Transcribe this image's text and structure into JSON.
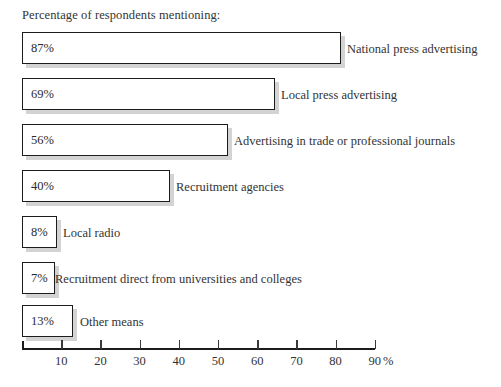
{
  "caption": "Percentage of respondents mentioning:",
  "axis": {
    "unit_label": "%",
    "tick_labels": [
      "10",
      "20",
      "30",
      "40",
      "50",
      "60",
      "70",
      "80",
      "90"
    ]
  },
  "chart_data": {
    "type": "bar",
    "orientation": "horizontal",
    "title": "Percentage of respondents mentioning:",
    "xlabel": "%",
    "ylabel": "",
    "xlim": [
      0,
      90
    ],
    "grid": false,
    "legend": "none",
    "categories": [
      "National press advertising",
      "Local press advertising",
      "Advertising in trade or professional journals",
      "Recruitment agencies",
      "Local radio",
      "Recruitment direct from universities and colleges",
      "Other means"
    ],
    "values": [
      87,
      69,
      56,
      40,
      8,
      7,
      13
    ],
    "value_labels": [
      "87%",
      "69%",
      "56%",
      "40%",
      "8%",
      "7%",
      "13%"
    ],
    "tick_values": [
      10,
      20,
      30,
      40,
      50,
      60,
      70,
      80,
      90
    ]
  },
  "render": {
    "bars": [
      {
        "label": "National press advertising",
        "value_label": "87%",
        "top": 32,
        "width": 319,
        "label_x": 347
      },
      {
        "label": "Local press advertising",
        "value_label": "69%",
        "top": 78,
        "width": 253,
        "label_x": 281
      },
      {
        "label": "Advertising in trade or professional journals",
        "value_label": "56%",
        "top": 124,
        "width": 206,
        "label_x": 234
      },
      {
        "label": "Recruitment agencies",
        "value_label": "40%",
        "top": 170,
        "width": 148,
        "label_x": 176
      },
      {
        "label": "Local radio",
        "value_label": "8%",
        "top": 216,
        "width": 35,
        "label_x": 63
      },
      {
        "label": "Recruitment direct from universities and colleges",
        "value_label": "7%",
        "top": 262,
        "width": 33,
        "label_x": 55
      },
      {
        "label": "Other means",
        "value_label": "13%",
        "top": 305,
        "width": 51,
        "label_x": 80
      }
    ],
    "axis_top": 340,
    "axis_left": 22,
    "axis_width": 353,
    "tick_step": 39.2,
    "unit_x": 383
  },
  "colors": {
    "bar_border": "#1c1c1c",
    "bar_fill": "#ffffff",
    "text": "#333333",
    "shadow": "#8c8c8c",
    "background": "#ffffff"
  }
}
